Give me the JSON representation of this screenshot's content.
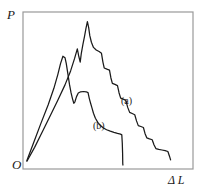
{
  "figure": {
    "background_color": "#ffffff",
    "line_color": "#1a1a1a",
    "frame_color": "#999999",
    "width": 201,
    "height": 195
  },
  "axes": {
    "y_label": "P",
    "x_label": "Δ L",
    "origin_label": "O",
    "frame": {
      "left": 23,
      "top": 12,
      "right": 193,
      "bottom": 169
    }
  },
  "labels": {
    "curve_a": "(a)",
    "curve_b": "(b)"
  },
  "chart_data": {
    "type": "line",
    "title": "",
    "xlabel": "Δ L",
    "ylabel": "P",
    "grid": false,
    "legend_position": "inline-annotation",
    "axis_ticks": false,
    "xlim": [
      0,
      1
    ],
    "ylim": [
      0,
      1
    ],
    "series": [
      {
        "name": "(a)",
        "label": "(a)",
        "annotation_point": [
          0.6,
          0.47
        ],
        "points": [
          [
            0.012,
            0.025
          ],
          [
            0.06,
            0.12
          ],
          [
            0.11,
            0.23
          ],
          [
            0.16,
            0.34
          ],
          [
            0.205,
            0.44
          ],
          [
            0.25,
            0.545
          ],
          [
            0.285,
            0.64
          ],
          [
            0.31,
            0.725
          ],
          [
            0.327,
            0.79
          ],
          [
            0.335,
            0.745
          ],
          [
            0.345,
            0.7
          ],
          [
            0.352,
            0.76
          ],
          [
            0.362,
            0.82
          ],
          [
            0.372,
            0.875
          ],
          [
            0.381,
            0.93
          ],
          [
            0.39,
            0.975
          ],
          [
            0.398,
            0.935
          ],
          [
            0.405,
            0.88
          ],
          [
            0.415,
            0.835
          ],
          [
            0.428,
            0.8
          ],
          [
            0.445,
            0.782
          ],
          [
            0.463,
            0.772
          ],
          [
            0.478,
            0.76
          ],
          [
            0.487,
            0.7
          ],
          [
            0.495,
            0.66
          ],
          [
            0.512,
            0.652
          ],
          [
            0.528,
            0.645
          ],
          [
            0.537,
            0.592
          ],
          [
            0.546,
            0.555
          ],
          [
            0.562,
            0.548
          ],
          [
            0.578,
            0.54
          ],
          [
            0.588,
            0.49
          ],
          [
            0.598,
            0.455
          ],
          [
            0.614,
            0.448
          ],
          [
            0.63,
            0.44
          ],
          [
            0.642,
            0.392
          ],
          [
            0.654,
            0.358
          ],
          [
            0.67,
            0.35
          ],
          [
            0.686,
            0.342
          ],
          [
            0.697,
            0.3
          ],
          [
            0.708,
            0.268
          ],
          [
            0.724,
            0.262
          ],
          [
            0.74,
            0.255
          ],
          [
            0.75,
            0.215
          ],
          [
            0.761,
            0.185
          ],
          [
            0.778,
            0.178
          ],
          [
            0.795,
            0.172
          ],
          [
            0.806,
            0.138
          ],
          [
            0.818,
            0.112
          ],
          [
            0.836,
            0.106
          ],
          [
            0.856,
            0.102
          ],
          [
            0.876,
            0.098
          ],
          [
            0.893,
            0.092
          ],
          [
            0.903,
            0.06
          ],
          [
            0.91,
            0.035
          ]
        ]
      },
      {
        "name": "(b)",
        "label": "(b)",
        "annotation_point": [
          0.425,
          0.3
        ],
        "points": [
          [
            0.012,
            0.03
          ],
          [
            0.055,
            0.155
          ],
          [
            0.1,
            0.285
          ],
          [
            0.145,
            0.41
          ],
          [
            0.18,
            0.52
          ],
          [
            0.205,
            0.615
          ],
          [
            0.222,
            0.69
          ],
          [
            0.237,
            0.74
          ],
          [
            0.25,
            0.73
          ],
          [
            0.258,
            0.69
          ],
          [
            0.268,
            0.62
          ],
          [
            0.278,
            0.548
          ],
          [
            0.288,
            0.49
          ],
          [
            0.297,
            0.45
          ],
          [
            0.305,
            0.42
          ],
          [
            0.312,
            0.43
          ],
          [
            0.322,
            0.465
          ],
          [
            0.333,
            0.49
          ],
          [
            0.348,
            0.498
          ],
          [
            0.366,
            0.5
          ],
          [
            0.382,
            0.498
          ],
          [
            0.394,
            0.492
          ],
          [
            0.402,
            0.452
          ],
          [
            0.41,
            0.42
          ],
          [
            0.418,
            0.39
          ],
          [
            0.428,
            0.352
          ],
          [
            0.44,
            0.318
          ],
          [
            0.455,
            0.29
          ],
          [
            0.472,
            0.268
          ],
          [
            0.49,
            0.252
          ],
          [
            0.51,
            0.24
          ],
          [
            0.533,
            0.23
          ],
          [
            0.556,
            0.222
          ],
          [
            0.578,
            0.215
          ],
          [
            0.597,
            0.21
          ],
          [
            0.605,
            0.205
          ],
          [
            0.608,
            0.15
          ],
          [
            0.61,
            0.08
          ],
          [
            0.611,
            0.01
          ],
          [
            0.612,
            0.0
          ]
        ]
      }
    ]
  }
}
